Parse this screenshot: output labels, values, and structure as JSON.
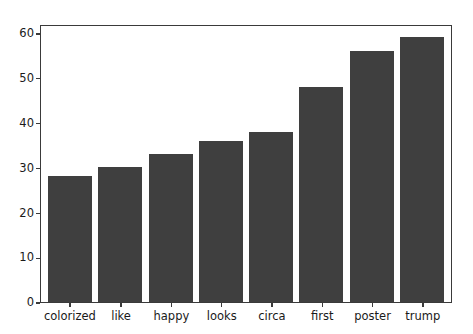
{
  "chart_data": {
    "type": "bar",
    "title": "",
    "subtitle": "",
    "xlabel": "",
    "ylabel": "",
    "categories": [
      "colorized",
      "like",
      "happy",
      "looks",
      "circa",
      "first",
      "poster",
      "trump"
    ],
    "values": [
      28,
      30,
      33,
      36,
      38,
      48,
      56,
      59
    ],
    "ytick_labels": [
      "0",
      "10",
      "20",
      "30",
      "40",
      "50",
      "60"
    ],
    "ytick_values": [
      0,
      10,
      20,
      30,
      40,
      50,
      60
    ],
    "ylim": [
      0,
      62
    ],
    "grid": false,
    "legend": null,
    "legend_position": "none",
    "annotations": [],
    "bar_color": "#3f3f3f",
    "axis_color": "#3a3a3a",
    "background_color": "#ffffff",
    "tick_label_color": "#1a1a1a"
  }
}
